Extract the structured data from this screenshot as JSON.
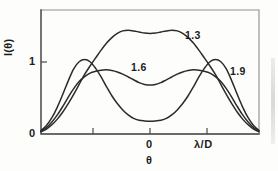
{
  "figure": {
    "background_color": "#fdfdfc",
    "ink_color": "#2b2b2b",
    "frame_color": "#8f8f8f"
  },
  "axes": {
    "y_label": "I(θ)",
    "x_label": "θ",
    "y_ticks": [
      "1",
      "0"
    ],
    "x_ticks": [
      "0",
      "λ/D"
    ],
    "y_tick_values": [
      1,
      0
    ],
    "x_tick_values": [
      0,
      1
    ]
  },
  "curve_labels": [
    "1.3",
    "1.6",
    "1.9"
  ],
  "chart_data": {
    "type": "line",
    "title": "",
    "xlabel": "θ",
    "ylabel": "I(θ)",
    "xlim": [
      -2,
      2
    ],
    "ylim": [
      0,
      1.75
    ],
    "xtick_labels": [
      "0",
      "λ/D"
    ],
    "xtick_positions": [
      0,
      1
    ],
    "ytick_labels": [
      "0",
      "1"
    ],
    "ytick_positions": [
      0,
      1
    ],
    "grid": false,
    "legend": "inline-annotations",
    "annotations": [
      {
        "text": "1.3",
        "x": 1.0,
        "y": 1.42
      },
      {
        "text": "1.6",
        "x": -0.07,
        "y": 1.0
      },
      {
        "text": "1.9",
        "x": 1.43,
        "y": 0.95
      }
    ],
    "x": [
      -2.0,
      -1.9,
      -1.8,
      -1.7,
      -1.6,
      -1.5,
      -1.4,
      -1.3,
      -1.2,
      -1.1,
      -1.0,
      -0.9,
      -0.8,
      -0.7,
      -0.6,
      -0.5,
      -0.4,
      -0.3,
      -0.2,
      -0.1,
      0.0,
      0.1,
      0.2,
      0.3,
      0.4,
      0.5,
      0.6,
      0.7,
      0.8,
      0.9,
      1.0,
      1.1,
      1.2,
      1.3,
      1.4,
      1.5,
      1.6,
      1.7,
      1.8,
      1.9,
      2.0
    ],
    "series": [
      {
        "name": "1.3",
        "values": [
          0.03,
          0.07,
          0.13,
          0.21,
          0.31,
          0.43,
          0.56,
          0.7,
          0.84,
          0.96,
          1.07,
          1.18,
          1.28,
          1.36,
          1.42,
          1.455,
          1.465,
          1.455,
          1.44,
          1.425,
          1.42,
          1.425,
          1.44,
          1.455,
          1.465,
          1.455,
          1.42,
          1.36,
          1.28,
          1.18,
          1.07,
          0.96,
          0.84,
          0.7,
          0.56,
          0.43,
          0.31,
          0.21,
          0.13,
          0.07,
          0.03
        ]
      },
      {
        "name": "1.6",
        "values": [
          0.04,
          0.09,
          0.17,
          0.27,
          0.39,
          0.52,
          0.64,
          0.74,
          0.81,
          0.86,
          0.885,
          0.9,
          0.905,
          0.895,
          0.875,
          0.845,
          0.805,
          0.765,
          0.725,
          0.7,
          0.69,
          0.7,
          0.725,
          0.765,
          0.805,
          0.845,
          0.875,
          0.895,
          0.905,
          0.9,
          0.885,
          0.86,
          0.81,
          0.74,
          0.64,
          0.52,
          0.39,
          0.27,
          0.17,
          0.09,
          0.04
        ]
      },
      {
        "name": "1.9",
        "values": [
          0.05,
          0.12,
          0.23,
          0.38,
          0.56,
          0.75,
          0.92,
          1.02,
          1.05,
          1.02,
          0.93,
          0.81,
          0.67,
          0.54,
          0.43,
          0.34,
          0.27,
          0.22,
          0.195,
          0.185,
          0.18,
          0.185,
          0.195,
          0.22,
          0.27,
          0.34,
          0.43,
          0.54,
          0.67,
          0.81,
          0.93,
          1.02,
          1.05,
          1.02,
          0.92,
          0.75,
          0.56,
          0.38,
          0.23,
          0.12,
          0.05
        ]
      }
    ]
  }
}
